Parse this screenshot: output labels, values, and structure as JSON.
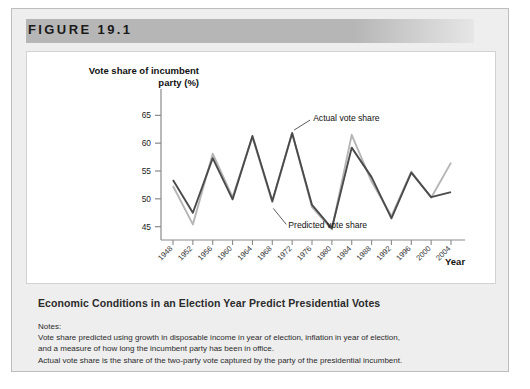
{
  "figure": {
    "label": "FIGURE 19.1",
    "caption": "Economic Conditions in an Election Year Predict Presidential Votes"
  },
  "notes": {
    "heading": "Notes:",
    "line1": "Vote share predicted using growth in disposable income in year of election, inflation in year of election,",
    "line2": "and a measure of how long the incumbent party has been in office.",
    "line3": "Actual vote share is the share of the two-party vote captured by the party of the presidential incumbent."
  },
  "chart_data": {
    "type": "line",
    "title": "Economic Conditions in an Election Year Predict Presidential Votes",
    "xlabel": "Year",
    "ylabel": "Vote share of incumbent party (%)",
    "ylim": [
      43.5,
      66.5
    ],
    "yticks": [
      45,
      50,
      55,
      60,
      65
    ],
    "grid": false,
    "legend_position": "inline-annotations",
    "categories": [
      1948,
      1952,
      1956,
      1960,
      1964,
      1968,
      1972,
      1976,
      1980,
      1984,
      1988,
      1992,
      1996,
      2000,
      2004
    ],
    "xticklabels": [
      "1948",
      "1952",
      "1956",
      "1960",
      "1964",
      "1968",
      "1972",
      "1976",
      "1980",
      "1984",
      "1988",
      "1992",
      "1996",
      "2000",
      "2004"
    ],
    "series": [
      {
        "name": "Actual vote share",
        "color": "#4a4a4a",
        "values": [
          53.4,
          47.5,
          57.3,
          49.9,
          61.3,
          49.6,
          61.8,
          48.9,
          44.7,
          59.2,
          53.9,
          46.5,
          54.7,
          50.3,
          51.2
        ]
      },
      {
        "name": "Predicted vote share",
        "color": "#b5b5b5",
        "values": [
          52.3,
          45.4,
          58.1,
          50.3,
          61.1,
          49.4,
          61.9,
          48.5,
          44.5,
          61.5,
          53.1,
          46.9,
          54.9,
          50.2,
          56.5
        ]
      }
    ],
    "annotations": [
      {
        "text": "Actual vote share",
        "points_to_year": 1972,
        "points_to_value": 62.0
      },
      {
        "text": "Predicted vote share",
        "points_to_year": 1968,
        "points_to_value": 49.0
      }
    ]
  }
}
